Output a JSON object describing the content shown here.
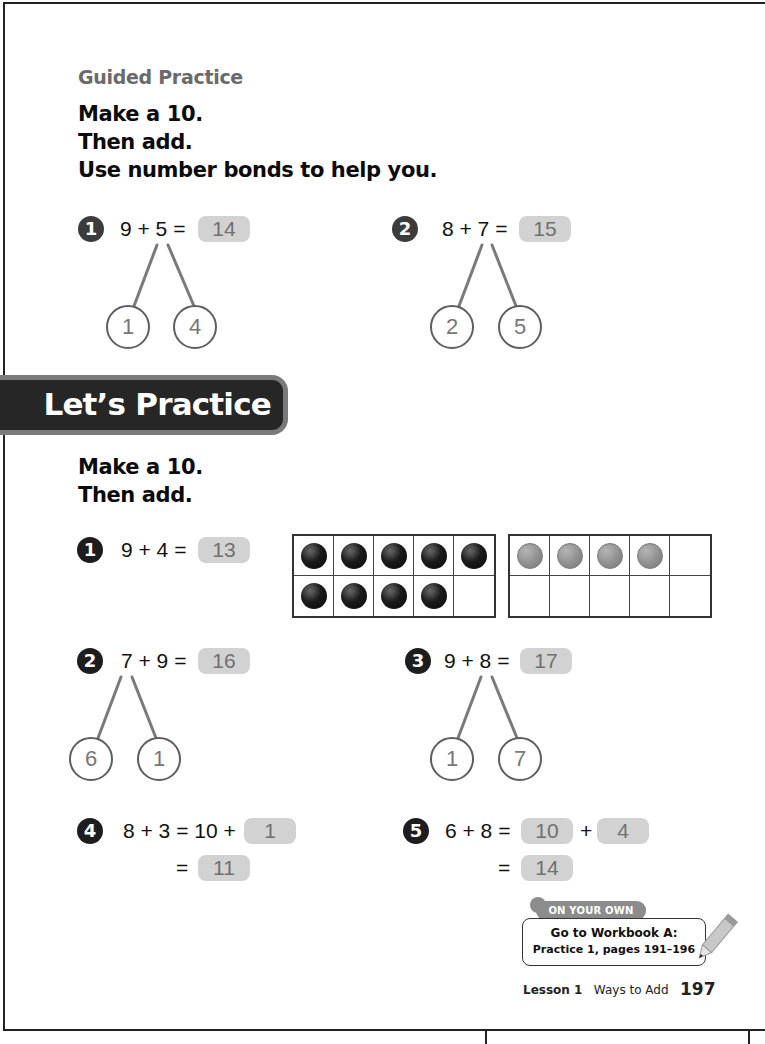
{
  "guided_practice": {
    "title": "Guided Practice",
    "instructions": [
      "Make a 10.",
      "Then add.",
      "Use number bonds to help you."
    ],
    "problems": [
      {
        "number": "1",
        "equation": "9 + 5 =",
        "answer": "14",
        "bond": [
          "1",
          "4"
        ]
      },
      {
        "number": "2",
        "equation": "8 + 7 =",
        "answer": "15",
        "bond": [
          "2",
          "5"
        ]
      }
    ]
  },
  "lets_practice": {
    "banner": "Let’s Practice",
    "instructions": [
      "Make a 10.",
      "Then add."
    ],
    "problems": [
      {
        "number": "1",
        "equation": "9 + 4 =",
        "answer": "13",
        "ten_frames": [
          {
            "filled": 9,
            "color": "black"
          },
          {
            "filled": 4,
            "color": "grey"
          }
        ]
      },
      {
        "number": "2",
        "equation": "7 + 9 =",
        "answer": "16",
        "bond": [
          "6",
          "1"
        ]
      },
      {
        "number": "3",
        "equation": "9 + 8 =",
        "answer": "17",
        "bond": [
          "1",
          "7"
        ]
      },
      {
        "number": "4",
        "equation": "8 + 3 = 10 +",
        "answer1": "1",
        "eq2": "=",
        "answer2": "11"
      },
      {
        "number": "5",
        "equation": "6 + 8 =",
        "answer1": "10",
        "plus": "+",
        "answer_mid": "4",
        "eq2": "=",
        "answer2": "14"
      }
    ]
  },
  "on_your_own": {
    "tag": "ON YOUR OWN",
    "line1": "Go to Workbook A:",
    "line2": "Practice 1, pages 191–196"
  },
  "footer": {
    "lesson": "Lesson 1",
    "title": "Ways to Add",
    "page": "197"
  },
  "colors": {
    "answer_bg": "#d2d2d2",
    "answer_text": "#707070",
    "banner_bg": "#262626",
    "banner_border": "#7a7a7a"
  }
}
